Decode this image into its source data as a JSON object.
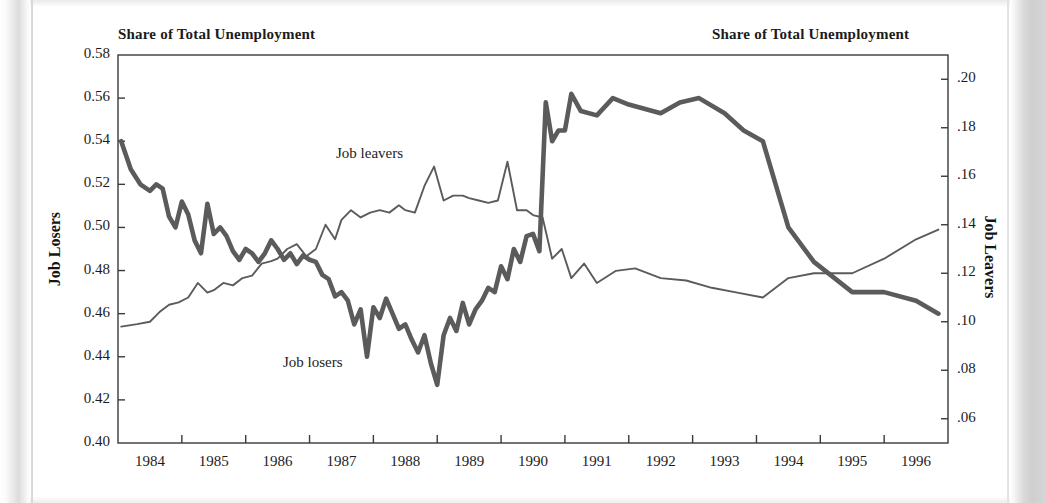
{
  "titles": {
    "left": "Share of Total Unemployment",
    "right": "Share of Total Unemployment"
  },
  "axis_labels": {
    "left": "Job Losers",
    "right": "Job Leavers"
  },
  "annotations": {
    "leavers": "Job leavers",
    "losers": "Job losers"
  },
  "colors": {
    "line": "#5b5b5b",
    "axis": "#3a3a3a",
    "text": "#1c1c1c",
    "background": "#ffffff"
  },
  "chart_data": {
    "type": "line",
    "title": "Share of Total Unemployment",
    "xlabel": "",
    "ylabel": "Job Losers",
    "y2label": "Job Leavers",
    "xlim": [
      1983.5,
      1996.5
    ],
    "ylim": [
      0.4,
      0.58
    ],
    "y2lim": [
      0.05,
      0.21
    ],
    "grid": false,
    "legend": "inline-annotations",
    "xticks": [
      "1984",
      "1985",
      "1986",
      "1987",
      "1988",
      "1989",
      "1990",
      "1991",
      "1992",
      "1993",
      "1994",
      "1995",
      "1996"
    ],
    "yticks_left": [
      "0.40",
      "0.42",
      "0.44",
      "0.46",
      "0.48",
      "0.50",
      "0.52",
      "0.54",
      "0.56",
      "0.58"
    ],
    "yticks_right": [
      ".06",
      ".08",
      ".10",
      ".12",
      ".14",
      ".16",
      ".18",
      ".20"
    ],
    "series": [
      {
        "name": "Job losers",
        "axis": "left",
        "style": "thick",
        "x": [
          1983.55,
          1983.7,
          1983.85,
          1984.0,
          1984.1,
          1984.2,
          1984.3,
          1984.4,
          1984.5,
          1984.6,
          1984.7,
          1984.8,
          1984.9,
          1985.0,
          1985.1,
          1985.2,
          1985.3,
          1985.4,
          1985.5,
          1985.6,
          1985.7,
          1985.8,
          1985.9,
          1986.0,
          1986.1,
          1986.2,
          1986.3,
          1986.4,
          1986.5,
          1986.6,
          1986.7,
          1986.8,
          1986.9,
          1987.0,
          1987.1,
          1987.2,
          1987.3,
          1987.4,
          1987.5,
          1987.6,
          1987.7,
          1987.8,
          1987.9,
          1988.0,
          1988.1,
          1988.2,
          1988.3,
          1988.4,
          1988.5,
          1988.6,
          1988.7,
          1988.8,
          1988.9,
          1989.0,
          1989.1,
          1989.2,
          1989.3,
          1989.4,
          1989.5,
          1989.6,
          1989.7,
          1989.8,
          1989.9,
          1990.0,
          1990.1,
          1990.2,
          1990.3,
          1990.4,
          1990.5,
          1990.6,
          1990.75,
          1991.0,
          1991.25,
          1991.5,
          1992.0,
          1992.3,
          1992.6,
          1993.0,
          1993.3,
          1993.6,
          1994.0,
          1994.4,
          1995.0,
          1995.5,
          1996.0,
          1996.35
        ],
        "y": [
          0.54,
          0.527,
          0.52,
          0.517,
          0.52,
          0.518,
          0.505,
          0.5,
          0.512,
          0.506,
          0.494,
          0.488,
          0.511,
          0.497,
          0.5,
          0.496,
          0.489,
          0.485,
          0.49,
          0.488,
          0.484,
          0.488,
          0.494,
          0.49,
          0.485,
          0.488,
          0.483,
          0.487,
          0.485,
          0.484,
          0.478,
          0.476,
          0.468,
          0.47,
          0.466,
          0.455,
          0.462,
          0.44,
          0.463,
          0.458,
          0.467,
          0.46,
          0.453,
          0.455,
          0.448,
          0.442,
          0.45,
          0.437,
          0.427,
          0.45,
          0.458,
          0.452,
          0.465,
          0.455,
          0.462,
          0.466,
          0.472,
          0.47,
          0.482,
          0.476,
          0.49,
          0.484,
          0.496,
          0.497,
          0.489,
          0.558,
          0.54,
          0.545,
          0.545,
          0.562,
          0.554,
          0.552,
          0.56,
          0.557,
          0.553,
          0.558,
          0.56,
          0.553,
          0.545,
          0.54,
          0.5,
          0.484,
          0.47,
          0.47,
          0.466,
          0.46
        ]
      },
      {
        "name": "Job leavers",
        "axis": "right",
        "style": "thin",
        "x": [
          1983.55,
          1983.8,
          1984.0,
          1984.15,
          1984.3,
          1984.45,
          1984.6,
          1984.75,
          1984.9,
          1985.0,
          1985.15,
          1985.3,
          1985.45,
          1985.6,
          1985.75,
          1985.9,
          1986.0,
          1986.15,
          1986.3,
          1986.45,
          1986.6,
          1986.75,
          1986.9,
          1987.0,
          1987.15,
          1987.3,
          1987.45,
          1987.6,
          1987.75,
          1987.9,
          1988.0,
          1988.15,
          1988.3,
          1988.45,
          1988.6,
          1988.75,
          1988.9,
          1989.0,
          1989.15,
          1989.3,
          1989.45,
          1989.6,
          1989.75,
          1989.9,
          1990.0,
          1990.15,
          1990.3,
          1990.45,
          1990.6,
          1990.8,
          1991.0,
          1991.3,
          1991.6,
          1992.0,
          1992.4,
          1992.8,
          1993.2,
          1993.6,
          1994.0,
          1994.4,
          1995.0,
          1995.5,
          1996.0,
          1996.35
        ],
        "y": [
          0.098,
          0.099,
          0.1,
          0.104,
          0.107,
          0.108,
          0.11,
          0.116,
          0.112,
          0.113,
          0.116,
          0.115,
          0.118,
          0.119,
          0.124,
          0.125,
          0.126,
          0.13,
          0.132,
          0.127,
          0.13,
          0.14,
          0.134,
          0.142,
          0.146,
          0.143,
          0.145,
          0.146,
          0.145,
          0.148,
          0.146,
          0.145,
          0.156,
          0.164,
          0.15,
          0.152,
          0.152,
          0.151,
          0.15,
          0.149,
          0.15,
          0.166,
          0.146,
          0.146,
          0.144,
          0.143,
          0.126,
          0.13,
          0.118,
          0.124,
          0.116,
          0.121,
          0.122,
          0.118,
          0.117,
          0.114,
          0.112,
          0.11,
          0.118,
          0.12,
          0.12,
          0.126,
          0.134,
          0.138
        ]
      }
    ]
  }
}
